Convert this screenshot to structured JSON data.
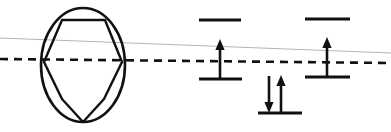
{
  "figure": {
    "title": "",
    "background_color": "#ffffff",
    "width": 391,
    "height": 132,
    "ink_color": "#111111",
    "guide_color": "#b4b4b4"
  },
  "chart_data": {
    "type": "diagram",
    "title": "",
    "subtitle": "",
    "xlabel": "",
    "ylabel": "",
    "legend": [],
    "annotations": [],
    "panels": [
      {
        "name": "hexagon-in-circle",
        "description": "hexagon inscribed in circle",
        "circle": {
          "cx": 83,
          "cy": 65,
          "rx": 42,
          "ry": 57
        },
        "polygon_points": "62,20 105,20 122,62 104,99 83,122 62,99 44,62",
        "hexagon_vertices": [
          {
            "x": 62,
            "y": 20
          },
          {
            "x": 105,
            "y": 20
          },
          {
            "x": 122,
            "y": 62
          },
          {
            "x": 83,
            "y": 122
          },
          {
            "x": 44,
            "y": 62
          }
        ]
      },
      {
        "name": "energy-level-diagram",
        "description": "three orbital levels with electron spin arrows",
        "levels": [
          {
            "name": "left-upper-level",
            "x1": 199,
            "x2": 241,
            "y": 20,
            "electrons": []
          },
          {
            "name": "left-lower-level",
            "x1": 199,
            "x2": 242,
            "y": 79,
            "electrons": [
              {
                "name": "up-arrow",
                "spin": "up",
                "x": 220,
                "y_tail": 79,
                "y_head": 42
              }
            ]
          },
          {
            "name": "right-upper-level",
            "x1": 305,
            "x2": 350,
            "y": 19,
            "electrons": []
          },
          {
            "name": "right-lower-level",
            "x1": 305,
            "x2": 350,
            "y": 77,
            "electrons": [
              {
                "name": "up-arrow",
                "spin": "up",
                "x": 327,
                "y_tail": 77,
                "y_head": 40
              }
            ]
          },
          {
            "name": "middle-lower-level",
            "x1": 258,
            "x2": 302,
            "y": 113,
            "electrons": [
              {
                "name": "down-arrow",
                "spin": "down",
                "x": 269,
                "y_tail": 76,
                "y_head": 112
              },
              {
                "name": "up-arrow",
                "spin": "up",
                "x": 280,
                "y_tail": 112,
                "y_head": 76
              }
            ]
          }
        ]
      }
    ],
    "reference_lines": [
      {
        "name": "fermi-dashed-line",
        "style": "dashed",
        "color": "#111111",
        "x1": 0,
        "y1": 59,
        "x2": 391,
        "y2": 63
      },
      {
        "name": "thin-sloped-guide-line",
        "style": "solid-thin",
        "color": "#b4b4b4",
        "x1": 0,
        "y1": 38,
        "x2": 391,
        "y2": 53
      }
    ]
  }
}
